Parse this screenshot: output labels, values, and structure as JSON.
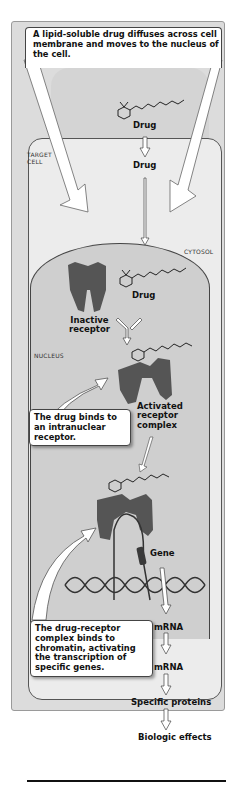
{
  "diagram": {
    "title_callout": "A lipid-soluble drug diffuses across cell membrane and moves to the nucleus of the cell.",
    "region_labels": {
      "target_cell": "TARGET\nCELL",
      "cytosol": "CYTOSOL",
      "nucleus": "NUCLEUS"
    },
    "labels": {
      "drug_outside": "Drug",
      "drug_membrane": "Drug",
      "drug_cytosol": "Drug",
      "inactive_receptor": "Inactive\nreceptor",
      "activated_complex": "Activated\nreceptor\ncomplex",
      "gene": "Gene",
      "mrna_1": "mRNA",
      "mrna_2": "mRNA",
      "specific_proteins": "Specific proteins",
      "biologic_effects": "Biologic effects"
    },
    "callouts": {
      "binds_receptor": "The drug binds to an intranuclear receptor.",
      "binds_chromatin": "The drug-receptor complex binds to chromatin, activating the transcription of specific genes."
    },
    "colors": {
      "frame": "#dcdcdc",
      "cell": "#ececec",
      "nucleus": "#cfcfcf",
      "receptor": "#555555",
      "gene": "#3a3a3a"
    }
  }
}
